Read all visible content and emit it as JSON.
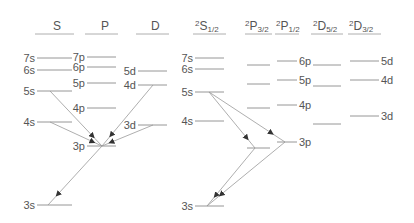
{
  "colors": {
    "line": "#8a8a8a",
    "text": "#555555",
    "arrow": "#333333"
  },
  "left_panel": {
    "columns": [
      {
        "label": "S",
        "sup": "",
        "sub": "",
        "x1": 37,
        "x2": 72,
        "header_x": 53
      },
      {
        "label": "P",
        "sup": "",
        "sub": "",
        "x1": 87,
        "x2": 116,
        "header_x": 101
      },
      {
        "label": "D",
        "sup": "",
        "sub": "",
        "x1": 138,
        "x2": 167,
        "header_x": 151
      }
    ],
    "levels": [
      {
        "label": "7s",
        "col": 0,
        "y": 58,
        "label_side": "left"
      },
      {
        "label": "6s",
        "col": 0,
        "y": 70,
        "label_side": "left"
      },
      {
        "label": "5s",
        "col": 0,
        "y": 91,
        "label_side": "left"
      },
      {
        "label": "4s",
        "col": 0,
        "y": 122,
        "label_side": "left"
      },
      {
        "label": "3s",
        "col": 0,
        "y": 205,
        "label_side": "left"
      },
      {
        "label": "7p",
        "col": 1,
        "y": 57,
        "label_side": "left"
      },
      {
        "label": "6p",
        "col": 1,
        "y": 67,
        "label_side": "left"
      },
      {
        "label": "5p",
        "col": 1,
        "y": 83,
        "label_side": "left"
      },
      {
        "label": "4p",
        "col": 1,
        "y": 108,
        "label_side": "left"
      },
      {
        "label": "3p",
        "col": 1,
        "y": 146,
        "label_side": "left"
      },
      {
        "label": "5d",
        "col": 2,
        "y": 71,
        "label_side": "left"
      },
      {
        "label": "4d",
        "col": 2,
        "y": 85,
        "label_side": "left"
      },
      {
        "label": "3d",
        "col": 2,
        "y": 125,
        "label_side": "left"
      }
    ],
    "transitions": [
      {
        "from": "5s",
        "to": "3p",
        "x1": 50,
        "y1": 91,
        "x2": 102,
        "y2": 146
      },
      {
        "from": "4s",
        "to": "3p",
        "x1": 50,
        "y1": 122,
        "x2": 102,
        "y2": 146
      },
      {
        "from": "4d",
        "to": "3p",
        "x1": 153,
        "y1": 85,
        "x2": 102,
        "y2": 146
      },
      {
        "from": "3d",
        "to": "3p",
        "x1": 153,
        "y1": 125,
        "x2": 102,
        "y2": 146
      },
      {
        "from": "3p",
        "to": "3s",
        "x1": 102,
        "y1": 146,
        "x2": 48,
        "y2": 205
      }
    ]
  },
  "right_panel": {
    "columns": [
      {
        "label": "S",
        "sup": "2",
        "sub": "1/2",
        "x1": 195,
        "x2": 224,
        "header_x": 195
      },
      {
        "label": "P",
        "sup": "2",
        "sub": "3/2",
        "x1": 247,
        "x2": 270,
        "header_x": 245
      },
      {
        "label": "P",
        "sup": "2",
        "sub": "1/2",
        "x1": 277,
        "x2": 297,
        "header_x": 276
      },
      {
        "label": "D",
        "sup": "2",
        "sub": "5/2",
        "x1": 313,
        "x2": 341,
        "header_x": 313
      },
      {
        "label": "D",
        "sup": "2",
        "sub": "3/2",
        "x1": 350,
        "x2": 379,
        "header_x": 349
      }
    ],
    "levels": [
      {
        "label": "7s",
        "col": 0,
        "y": 58,
        "label_side": "left"
      },
      {
        "label": "6s",
        "col": 0,
        "y": 69,
        "label_side": "left"
      },
      {
        "label": "5s",
        "col": 0,
        "y": 92,
        "label_side": "left"
      },
      {
        "label": "4s",
        "col": 0,
        "y": 121,
        "label_side": "left"
      },
      {
        "label": "3s",
        "col": 0,
        "y": 206,
        "label_side": "left"
      },
      {
        "label": "",
        "col": 1,
        "y": 65
      },
      {
        "label": "",
        "col": 1,
        "y": 84
      },
      {
        "label": "",
        "col": 1,
        "y": 108
      },
      {
        "label": "",
        "col": 1,
        "y": 148
      },
      {
        "label": "6p",
        "col": 2,
        "y": 61,
        "label_side": "right"
      },
      {
        "label": "5p",
        "col": 2,
        "y": 80,
        "label_side": "right"
      },
      {
        "label": "4p",
        "col": 2,
        "y": 105,
        "label_side": "right"
      },
      {
        "label": "3p",
        "col": 2,
        "y": 142,
        "label_side": "right"
      },
      {
        "label": "",
        "col": 3,
        "y": 65
      },
      {
        "label": "",
        "col": 3,
        "y": 86
      },
      {
        "label": "",
        "col": 3,
        "y": 124
      },
      {
        "label": "5d",
        "col": 4,
        "y": 61,
        "label_side": "right"
      },
      {
        "label": "4d",
        "col": 4,
        "y": 80,
        "label_side": "right"
      },
      {
        "label": "3d",
        "col": 4,
        "y": 116,
        "label_side": "right"
      }
    ],
    "transitions": [
      {
        "from": "5s",
        "to": "3p 2P3/2",
        "x1": 209,
        "y1": 92,
        "x2": 255,
        "y2": 148
      },
      {
        "from": "5s",
        "to": "3p 2P1/2",
        "x1": 209,
        "y1": 92,
        "x2": 285,
        "y2": 142
      },
      {
        "from": "3p 2P3/2",
        "to": "3s",
        "x1": 255,
        "y1": 148,
        "x2": 207,
        "y2": 206
      },
      {
        "from": "3p 2P1/2",
        "to": "3s",
        "x1": 285,
        "y1": 142,
        "x2": 207,
        "y2": 206
      }
    ]
  }
}
